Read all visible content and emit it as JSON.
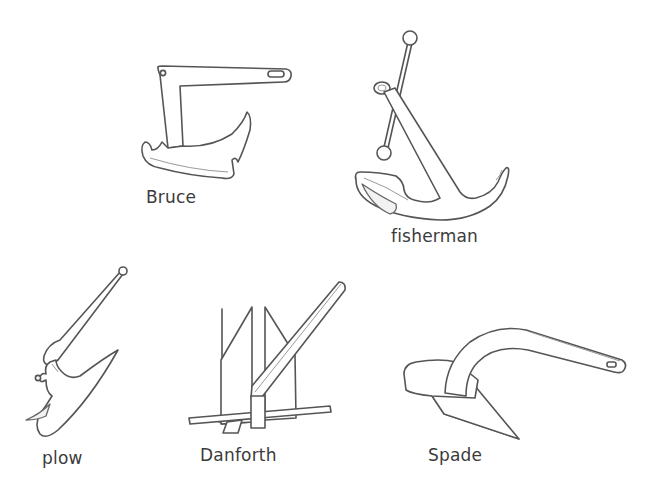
{
  "figure": {
    "kind": "anchor types illustration",
    "colors": {
      "background": "#ffffff",
      "line": "#555555",
      "label_text": "#3b3b3b"
    },
    "anchors": [
      {
        "id": "bruce",
        "label": "Bruce",
        "icon": "bruce-anchor-icon"
      },
      {
        "id": "fisherman",
        "label": "fisherman",
        "icon": "fisherman-anchor-icon"
      },
      {
        "id": "plow",
        "label": "plow",
        "icon": "plow-anchor-icon"
      },
      {
        "id": "danforth",
        "label": "Danforth",
        "icon": "danforth-anchor-icon"
      },
      {
        "id": "spade",
        "label": "Spade",
        "icon": "spade-anchor-icon"
      }
    ]
  }
}
